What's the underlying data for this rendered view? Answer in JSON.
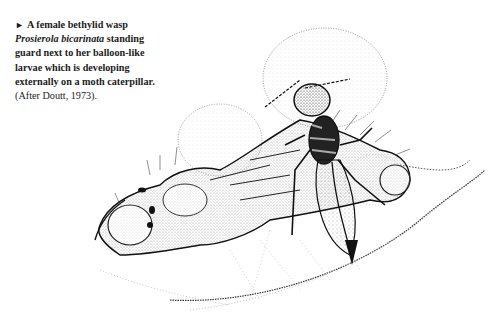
{
  "page": {
    "cutoff_previous_line": "",
    "caption": {
      "marker_icon": "triangle-right-icon",
      "marker_glyph": "►",
      "line1": "A female bethylid wasp",
      "species_name": "Prosierola bicarinata",
      "line2_rest": " standing",
      "line3": "guard next to her balloon-like",
      "line4": "larvae which is developing",
      "line5": "externally on a moth caterpillar.",
      "reference": "(After Doutt, 1973)."
    },
    "illustration": {
      "subject": "bethylid-wasp-guarding-larvae-on-caterpillar",
      "ink_color": "#111111",
      "stipple_color": "#777777"
    }
  }
}
